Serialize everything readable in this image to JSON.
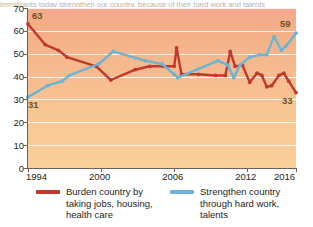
{
  "topstrip": {
    "text": "immigrants today strengthen our country, because of their hard work and talents"
  },
  "chart_data": {
    "type": "line",
    "title": "",
    "xlabel": "",
    "ylabel": "",
    "xlim": [
      1994,
      2016
    ],
    "ylim": [
      0,
      70
    ],
    "grid": true,
    "legend_position": "bottom",
    "yticks": [
      0,
      10,
      20,
      30,
      40,
      50,
      60,
      70
    ],
    "xticks": [
      1994,
      2000,
      2006,
      2012,
      2016
    ],
    "annotations": [
      {
        "text": "63",
        "x": 1994,
        "y": 63,
        "series": "Burden country by taking jobs, housing, health care"
      },
      {
        "text": "31",
        "x": 1994,
        "y": 31,
        "series": "Strengthen country through hard work, talents"
      },
      {
        "text": "59",
        "x": 2016,
        "y": 59,
        "series": "Strengthen country through hard work, talents"
      },
      {
        "text": "33",
        "x": 2016,
        "y": 33,
        "series": "Burden country by taking jobs, housing, health care"
      }
    ],
    "series": [
      {
        "name": "Burden country by taking jobs, housing, health care",
        "color": "#c0392b",
        "x": [
          1994,
          1995.4,
          1996.5,
          1997.2,
          1999.6,
          2000.8,
          2002.8,
          2004.0,
          2005.1,
          2006.0,
          2006.2,
          2006.6,
          2008.0,
          2009.4,
          2010.2,
          2010.6,
          2011.0,
          2011.6,
          2012.2,
          2012.8,
          2013.2,
          2013.6,
          2014.0,
          2014.6,
          2015.0,
          2015.4,
          2016.0
        ],
        "values": [
          63,
          54,
          51.5,
          48.5,
          44.5,
          38.5,
          43,
          44.5,
          44.5,
          44.5,
          52.5,
          41,
          41,
          40.5,
          40.5,
          51,
          44.5,
          45,
          37.5,
          41.5,
          40.5,
          35.5,
          36,
          40.5,
          41.5,
          38,
          33
        ]
      },
      {
        "name": "Strengthen country through hard work, talents",
        "color": "#6ab4d4",
        "x": [
          1994,
          1995.6,
          1996.8,
          1997.4,
          1999.8,
          2001.0,
          2003.6,
          2005.0,
          2006.0,
          2006.3,
          2009.6,
          2010.4,
          2010.9,
          2011.4,
          2012.2,
          2013.0,
          2013.6,
          2014.2,
          2014.8,
          2015.2,
          2016.0
        ],
        "values": [
          31,
          36,
          38,
          40.5,
          45.5,
          51,
          47,
          45.5,
          41,
          39.5,
          47,
          45,
          39.5,
          45,
          48.5,
          49.5,
          49.5,
          57.5,
          51.5,
          53.5,
          59
        ]
      }
    ]
  },
  "legend": [
    {
      "label": "Burden country by taking jobs, housing, health care",
      "color": "#c0392b"
    },
    {
      "label": "Strengthen country through hard work, talents",
      "color": "#6ab4d4"
    }
  ]
}
